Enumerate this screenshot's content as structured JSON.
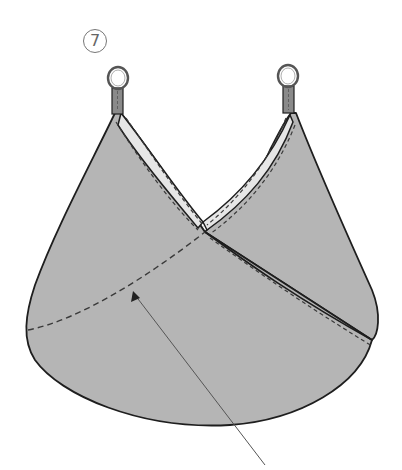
{
  "diagram": {
    "step_number": "7",
    "colors": {
      "fabric": "#b5b5b5",
      "lining": "#e6e6e6",
      "outline": "#1e1e1e",
      "stitch": "#3a3a3a",
      "ring": "#555555",
      "tab": "#8a8a8a",
      "arrow": "#555555",
      "background": "#ffffff"
    },
    "parts": [
      {
        "name": "left-ring-handle"
      },
      {
        "name": "right-ring-handle"
      },
      {
        "name": "left-strap-tab"
      },
      {
        "name": "right-strap-tab"
      },
      {
        "name": "front-panel"
      },
      {
        "name": "back-panel"
      },
      {
        "name": "crossover-edge-lining"
      },
      {
        "name": "curved-stitch-line"
      },
      {
        "name": "pointer-arrow"
      }
    ]
  }
}
